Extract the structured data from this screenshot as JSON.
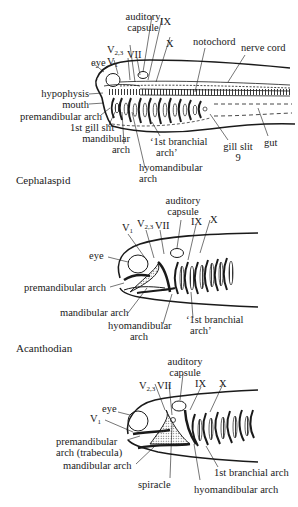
{
  "figure": {
    "panels": [
      {
        "caption": "Cephalaspid",
        "labels": {
          "auditory_capsule": [
            "auditory",
            "capsule"
          ],
          "v23": "V",
          "v23_sub": "2,3",
          "v1": "V",
          "v1_sub": "1",
          "vii": "VII",
          "ix": "IX",
          "x": "X",
          "eye": "eye",
          "notochord": "notochord",
          "nerve_cord": "nerve cord",
          "hypophysis": "hypophysis",
          "mouth": "mouth",
          "premandibular_arch": "premandibular arch",
          "first_gill_slit": "1st gill slit",
          "mandibular_arch": [
            "mandibular",
            "arch"
          ],
          "first_branchial_arch": [
            "‘1st branchial",
            "arch’"
          ],
          "hyomandibular_arch": [
            "hyomandibular",
            "arch"
          ],
          "gill_slit_9": [
            "gill slit",
            "9"
          ],
          "gut": "gut"
        }
      },
      {
        "caption": "Acanthodian",
        "labels": {
          "auditory_capsule": [
            "auditory",
            "capsule"
          ],
          "v1": "V",
          "v1_sub": "1",
          "v23": "V",
          "v23_sub": "2,3",
          "vii": "VII",
          "ix": "IX",
          "x": "X",
          "eye": "eye",
          "premandibular_arch": "premandibular arch",
          "mandibular_arch": "mandibular arch",
          "hyomandibular_arch": [
            "hyomandibular",
            "arch"
          ],
          "first_branchial_arch": [
            "‘1st branchial",
            "arch’"
          ]
        }
      },
      {
        "caption": "",
        "labels": {
          "auditory_capsule": [
            "auditory",
            "capsule"
          ],
          "v23": "V",
          "v23_sub": "2,3",
          "vii": "VII",
          "ix": "IX",
          "x": "X",
          "eye": "eye",
          "v1": "V",
          "v1_sub": "1",
          "premandibular_arch": [
            "premandibular",
            "arch (trabecula)"
          ],
          "mandibular_arch": "mandibular arch",
          "spiracle": "spiracle",
          "first_branchial_arch": "1st branchial arch",
          "hyomandibular_arch": "hyomandibular arch"
        }
      }
    ]
  }
}
